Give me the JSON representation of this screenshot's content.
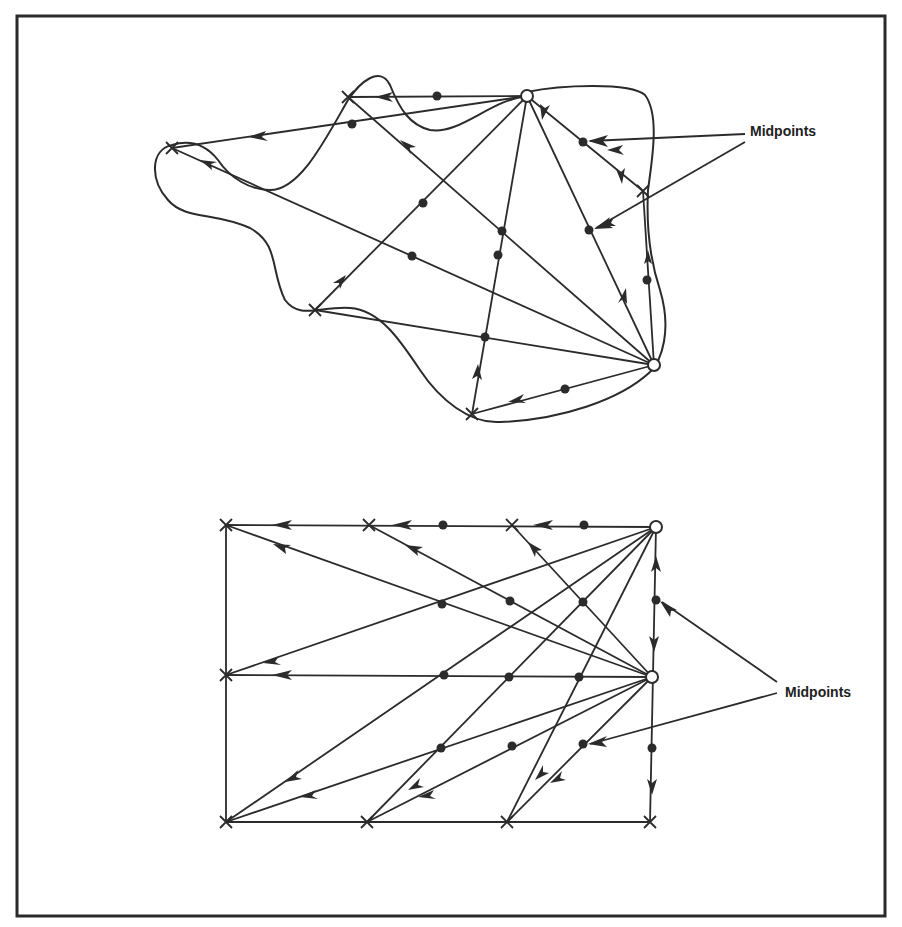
{
  "figure": {
    "colors": {
      "ink": "#2b2b2b",
      "background": "#ffffff"
    },
    "top_diagram": {
      "label": "Midpoints",
      "nodes": [
        {
          "id": "A",
          "x": 527,
          "y": 96
        },
        {
          "id": "B",
          "x": 654,
          "y": 365
        }
      ],
      "crosses": [
        {
          "x": 348,
          "y": 97
        },
        {
          "x": 172,
          "y": 148
        },
        {
          "x": 643,
          "y": 191
        },
        {
          "x": 315,
          "y": 310
        },
        {
          "x": 472,
          "y": 414
        }
      ],
      "midpoints": [
        {
          "x": 437,
          "y": 96
        },
        {
          "x": 352,
          "y": 124
        },
        {
          "x": 583,
          "y": 142
        },
        {
          "x": 589,
          "y": 230
        },
        {
          "x": 423,
          "y": 203
        },
        {
          "x": 412,
          "y": 256
        },
        {
          "x": 502,
          "y": 231
        },
        {
          "x": 498,
          "y": 255
        },
        {
          "x": 485,
          "y": 337
        },
        {
          "x": 647,
          "y": 280
        },
        {
          "x": 565,
          "y": 389
        }
      ]
    },
    "bottom_diagram": {
      "label": "Midpoints",
      "nodes": [
        {
          "id": "C",
          "x": 656,
          "y": 527
        },
        {
          "id": "D",
          "x": 652,
          "y": 677
        }
      ],
      "crosses": [
        {
          "x": 226,
          "y": 525
        },
        {
          "x": 369,
          "y": 525
        },
        {
          "x": 512,
          "y": 525
        },
        {
          "x": 226,
          "y": 675
        },
        {
          "x": 226,
          "y": 822
        },
        {
          "x": 367,
          "y": 822
        },
        {
          "x": 507,
          "y": 822
        },
        {
          "x": 650,
          "y": 822
        }
      ],
      "midpoints": [
        {
          "x": 443,
          "y": 525
        },
        {
          "x": 584,
          "y": 525
        },
        {
          "x": 442,
          "y": 604
        },
        {
          "x": 510,
          "y": 601
        },
        {
          "x": 583,
          "y": 602
        },
        {
          "x": 656,
          "y": 600
        },
        {
          "x": 444,
          "y": 675
        },
        {
          "x": 509,
          "y": 677
        },
        {
          "x": 579,
          "y": 677
        },
        {
          "x": 441,
          "y": 748
        },
        {
          "x": 512,
          "y": 746
        },
        {
          "x": 583,
          "y": 744
        },
        {
          "x": 652,
          "y": 748
        }
      ]
    }
  }
}
